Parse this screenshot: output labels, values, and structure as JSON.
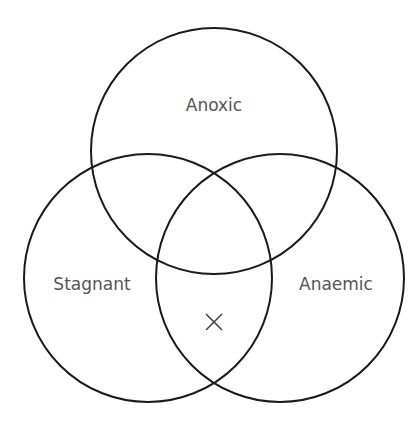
{
  "diagram": {
    "type": "venn",
    "sets": [
      {
        "id": "anoxic",
        "label": "Anoxic",
        "cx": 214,
        "cy": 151,
        "r": 123,
        "label_x": 214,
        "label_y": 106
      },
      {
        "id": "stagnant",
        "label": "Stagnant",
        "cx": 148,
        "cy": 278,
        "r": 124,
        "label_x": 92,
        "label_y": 285
      },
      {
        "id": "anaemic",
        "label": "Anaemic",
        "cx": 280,
        "cy": 278,
        "r": 124,
        "label_x": 336,
        "label_y": 285
      }
    ],
    "marker": {
      "label": "X",
      "region": "stagnant ∩ anaemic only",
      "x": 214,
      "y": 322,
      "size": 8
    },
    "colors": {
      "stroke": "#1a1a1a",
      "text": "#555555",
      "background": "#ffffff"
    }
  }
}
